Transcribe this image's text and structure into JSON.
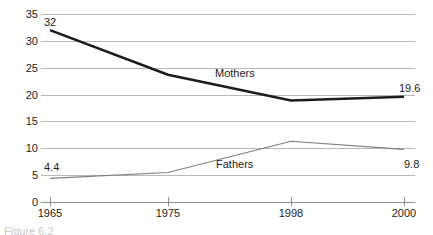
{
  "chart_data": {
    "type": "line",
    "title": "",
    "subtitle": "",
    "xlabel": "",
    "ylabel": "",
    "categories": [
      "1965",
      "1975",
      "1998",
      "2000"
    ],
    "ylim": [
      0,
      35
    ],
    "yticks": [
      "0",
      "5",
      "10",
      "15",
      "20",
      "25",
      "30",
      "35"
    ],
    "grid": true,
    "legend_position": "inline-labels",
    "series": [
      {
        "name": "Mothers",
        "values": [
          32,
          23.7,
          18.9,
          19.6
        ],
        "color": "#1c1c1c",
        "line_width": 2.6,
        "label_text": "Mothers"
      },
      {
        "name": "Fathers",
        "values": [
          4.4,
          5.5,
          11.3,
          9.8
        ],
        "color": "#7d7d7d",
        "line_width": 1.1,
        "label_text": "Fathers"
      }
    ],
    "annotations": [
      {
        "text": "32",
        "series": "Mothers",
        "position": "start-above"
      },
      {
        "text": "19.6",
        "series": "Mothers",
        "position": "end-right-above"
      },
      {
        "text": "4.4",
        "series": "Fathers",
        "position": "start-above"
      },
      {
        "text": "9.8",
        "series": "Fathers",
        "position": "end-right-below"
      }
    ]
  },
  "chart": {
    "series_labels": {
      "mothers": "Mothers",
      "fathers": "Fathers"
    },
    "value_labels": {
      "mothers_start": "32",
      "mothers_end": "19.6",
      "fathers_start": "4.4",
      "fathers_end": "9.8"
    },
    "y_ticks": [
      "35",
      "30",
      "25",
      "20",
      "15",
      "10",
      "5",
      "0"
    ],
    "x_ticks": [
      "1965",
      "1975",
      "1998",
      "2000"
    ],
    "colors": {
      "mothers_line": "#1c1c1c",
      "fathers_line": "#7d7d7d",
      "gridline": "#b9b9b9",
      "axis": "#8f8f8f",
      "text": "#1c1c1c",
      "background": "#ffffff"
    }
  },
  "figure": {
    "caption": "Figure 6.2"
  }
}
